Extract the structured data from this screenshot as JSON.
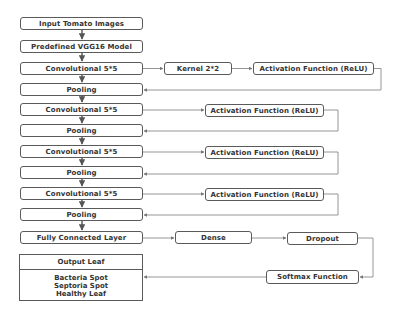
{
  "diagram": {
    "main_column": [
      {
        "id": "input",
        "label": "Input Tomato Images"
      },
      {
        "id": "vgg16",
        "label": "Predefined VGG16 Model"
      },
      {
        "id": "conv1",
        "label": "Convolutional 5*5"
      },
      {
        "id": "pool1",
        "label": "Pooling"
      },
      {
        "id": "conv2",
        "label": "Convolutional 5*5"
      },
      {
        "id": "pool2",
        "label": "Pooling"
      },
      {
        "id": "conv3",
        "label": "Convolutional 5*5"
      },
      {
        "id": "pool3",
        "label": "Pooling"
      },
      {
        "id": "conv4",
        "label": "Convolutional 5*5"
      },
      {
        "id": "pool4",
        "label": "Pooling"
      },
      {
        "id": "fc",
        "label": "Fully Connected Layer"
      }
    ],
    "side_blocks": {
      "kernel": {
        "label": "Kernel 2*2"
      },
      "activation1": {
        "label": "Activation Function (ReLU)"
      },
      "activation2": {
        "label": "Activation Function (ReLU)"
      },
      "activation3": {
        "label": "Activation Function (ReLU)"
      },
      "activation4": {
        "label": "Activation Function (ReLU)"
      },
      "dense": {
        "label": "Dense"
      },
      "dropout": {
        "label": "Dropout"
      },
      "softmax": {
        "label": "Softmax Function"
      }
    },
    "output": {
      "title": "Output Leaf",
      "classes": [
        "Bacteria Spot",
        "Septoria Spot",
        "Healthy Leaf"
      ]
    },
    "colors": {
      "border": "#5a5a5a",
      "text": "#333333",
      "line": "#8a8a8a",
      "background": "#ffffff"
    }
  }
}
